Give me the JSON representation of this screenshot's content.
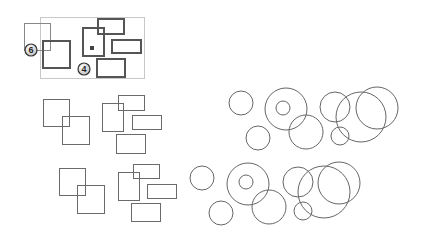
{
  "colors": {
    "panel_border": "#c8c8c8",
    "thick_stroke": "#555555",
    "thin_stroke": "#6a6a6a",
    "guide_stroke": "#888888",
    "badge_fill": "#f2f2f2",
    "badge_stroke": "#333333"
  },
  "panel": {
    "badges": [
      {
        "label": "6"
      },
      {
        "label": "4"
      }
    ]
  }
}
